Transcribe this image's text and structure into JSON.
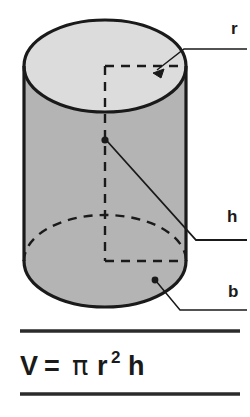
{
  "figure": {
    "shape_name": "cylinder",
    "colors": {
      "outline": "#1a1a1a",
      "top_face_fill": "#dcdcdc",
      "body_fill": "#b4b4b4",
      "background": "#ffffff",
      "rule": "#2b2b2b"
    },
    "labels": [
      {
        "id": "radius",
        "text": "r",
        "x": 231,
        "y": 34,
        "meaning": "radius"
      },
      {
        "id": "height",
        "text": "h",
        "x": 227,
        "y": 222,
        "meaning": "height"
      },
      {
        "id": "base",
        "text": "b",
        "x": 228,
        "y": 297,
        "meaning": "base"
      }
    ],
    "formula": {
      "full_text": "V = π r² h",
      "volume_symbol": "V",
      "equals": "=",
      "pi_symbol": "π",
      "radius_symbol": "r",
      "exponent": "2",
      "height_symbol": "h"
    },
    "rules": [
      {
        "id": "rule-top",
        "y": 331
      },
      {
        "id": "rule-bottom",
        "y": 394
      }
    ],
    "geometry": {
      "cx": 105,
      "left_x": 24,
      "right_x": 186,
      "top_y": 20,
      "bottom_y": 307,
      "rx": 81,
      "ry": 46,
      "top_ellipse_cy": 66,
      "bottom_ellipse_cy": 261,
      "center_dot": {
        "x": 105,
        "y": 140
      },
      "base_dot": {
        "x": 155,
        "y": 280
      },
      "radius_arrow_tip": {
        "x": 155,
        "y": 71
      }
    }
  }
}
